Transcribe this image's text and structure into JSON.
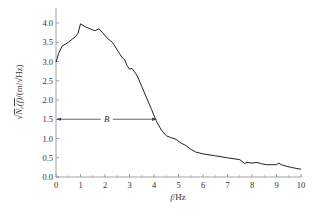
{
  "chart_data": {
    "type": "line",
    "title": "",
    "xlabel": "f/Hz",
    "xlabel_parts": {
      "var": "f",
      "unit": "/Hz"
    },
    "ylabel": "√(N_r(f)) /(m/√Hz)",
    "xlim": [
      0,
      10
    ],
    "ylim": [
      0,
      4.2
    ],
    "xticks": [
      0,
      1,
      2,
      3,
      4,
      5,
      6,
      7,
      8,
      9,
      10
    ],
    "xtick_labels": [
      "0",
      "1",
      "2",
      "3",
      "4",
      "5",
      "6",
      "7",
      "8",
      "9",
      "10"
    ],
    "yticks": [
      0.0,
      0.5,
      1.0,
      1.5,
      2.0,
      2.5,
      3.0,
      3.5,
      4.0
    ],
    "ytick_labels": [
      "0.0",
      "0.5",
      "1.0",
      "1.5",
      "2.0",
      "2.5",
      "3.0",
      "3.5",
      "4.0"
    ],
    "grid": false,
    "legend": null,
    "series": [
      {
        "name": "sqrt(Nr(f))",
        "color": "#222222",
        "x": [
          0.0,
          0.1,
          0.25,
          0.5,
          0.8,
          0.9,
          1.0,
          1.2,
          1.5,
          1.6,
          1.75,
          1.9,
          2.1,
          2.3,
          2.45,
          2.6,
          2.7,
          2.8,
          2.9,
          3.0,
          3.1,
          3.3,
          3.5,
          3.7,
          3.9,
          4.1,
          4.3,
          4.5,
          4.7,
          4.9,
          5.1,
          5.3,
          5.5,
          5.7,
          6.0,
          6.5,
          7.0,
          7.5,
          7.7,
          7.8,
          8.0,
          8.2,
          8.4,
          8.6,
          9.0,
          9.1,
          9.2,
          9.4,
          9.6,
          10.0
        ],
        "y": [
          2.98,
          3.2,
          3.4,
          3.5,
          3.65,
          3.73,
          3.98,
          3.9,
          3.82,
          3.8,
          3.85,
          3.75,
          3.6,
          3.5,
          3.35,
          3.2,
          3.1,
          3.05,
          2.9,
          2.8,
          2.82,
          2.65,
          2.35,
          2.05,
          1.75,
          1.45,
          1.22,
          1.07,
          1.02,
          0.98,
          0.88,
          0.82,
          0.72,
          0.65,
          0.6,
          0.55,
          0.5,
          0.45,
          0.35,
          0.38,
          0.36,
          0.38,
          0.34,
          0.32,
          0.32,
          0.36,
          0.32,
          0.28,
          0.25,
          0.2
        ]
      }
    ],
    "annotations": [
      {
        "type": "double-arrow",
        "label": "B",
        "from": [
          0,
          1.5
        ],
        "to": [
          4.1,
          1.5
        ]
      }
    ]
  }
}
